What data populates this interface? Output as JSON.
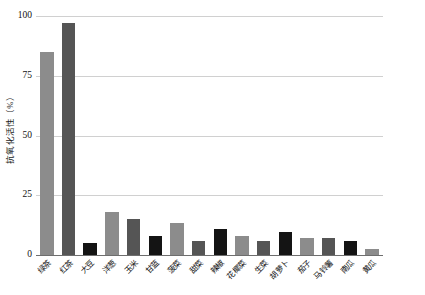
{
  "chart_data": {
    "type": "bar",
    "title": "",
    "xlabel": "",
    "ylabel": "抗氧化活性（%）",
    "ylim": [
      0,
      100
    ],
    "yticks": [
      0,
      25,
      50,
      75,
      100
    ],
    "ytick_labels": [
      "0",
      "25",
      "50",
      "75",
      "100"
    ],
    "grid": true,
    "legend": "none",
    "categories": [
      "绿茶",
      "红茶",
      "大豆",
      "洋葱",
      "玉米",
      "甘蓝",
      "菠菜",
      "甜菜",
      "辣椒",
      "花椰菜",
      "生菜",
      "胡萝卜",
      "茄子",
      "马铃薯",
      "南瓜",
      "黄瓜"
    ],
    "values": [
      85,
      97,
      5,
      18,
      15,
      8,
      13.5,
      6,
      11,
      8,
      6,
      9.5,
      7,
      7,
      6,
      2.5
    ],
    "bar_colors": [
      "#8c8c8c",
      "#555555",
      "#141414",
      "#8c8c8c",
      "#555555",
      "#141414",
      "#8c8c8c",
      "#555555",
      "#141414",
      "#8c8c8c",
      "#555555",
      "#141414",
      "#8c8c8c",
      "#555555",
      "#141414",
      "#8c8c8c"
    ],
    "axis_color": "#6e6e6e",
    "grid_color": "#d0d0d0",
    "background": "#ffffff"
  }
}
